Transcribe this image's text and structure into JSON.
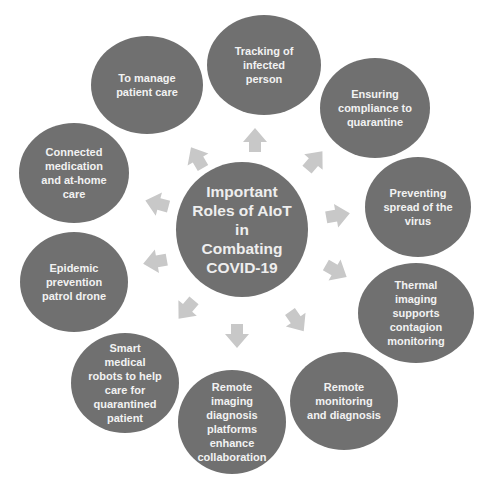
{
  "center": {
    "title": "Important Roles of AIoT in Combating COVID-19",
    "lines": [
      "Important",
      "Roles of AIoT",
      "in",
      "Combating",
      "COVID-19"
    ]
  },
  "nodes": [
    {
      "id": "tracking",
      "lines": [
        "Tracking of",
        "infected",
        "person"
      ]
    },
    {
      "id": "compliance",
      "lines": [
        "Ensuring",
        "compliance to",
        "quarantine"
      ]
    },
    {
      "id": "preventing",
      "lines": [
        "Preventing",
        "spread of the",
        "virus"
      ]
    },
    {
      "id": "thermal",
      "lines": [
        "Thermal",
        "imaging",
        "supports",
        "contagion",
        "monitoring"
      ]
    },
    {
      "id": "remote-monitoring",
      "lines": [
        "Remote",
        "monitoring",
        "and diagnosis"
      ]
    },
    {
      "id": "remote-imaging",
      "lines": [
        "Remote",
        "imaging",
        "diagnosis",
        "platforms",
        "enhance",
        "collaboration"
      ]
    },
    {
      "id": "robots",
      "lines": [
        "Smart",
        "medical",
        "robots to help",
        "care for",
        "quarantined",
        "patient"
      ]
    },
    {
      "id": "drone",
      "lines": [
        "Epidemic",
        "prevention",
        "patrol drone"
      ]
    },
    {
      "id": "medication",
      "lines": [
        "Connected",
        "medication",
        "and at-home",
        "care"
      ]
    },
    {
      "id": "patient-care",
      "lines": [
        "To manage",
        "patient care"
      ]
    }
  ],
  "colors": {
    "node_fill": "#707070",
    "node_text": "#f2f2f2",
    "arrow_fill": "#c8c8c8",
    "background": "#ffffff"
  }
}
